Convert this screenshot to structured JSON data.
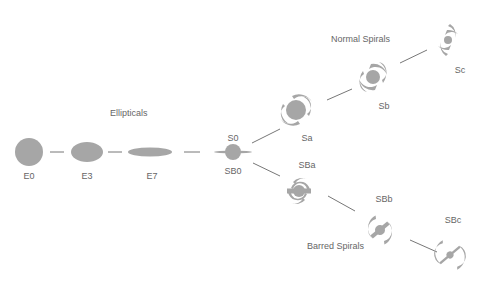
{
  "diagram": {
    "colors": {
      "galaxy": "#a6a6a6",
      "line": "#777777",
      "text": "#666666"
    },
    "groups": {
      "ellipticals": "Ellipticals",
      "normal_spirals": "Normal Spirals",
      "barred_spirals": "Barred Spirals"
    },
    "nodes": {
      "e0": "E0",
      "e3": "E3",
      "e7": "E7",
      "s0": "S0",
      "sb0": "SB0",
      "sa": "Sa",
      "sb": "Sb",
      "sc": "Sc",
      "sba": "SBa",
      "sbb": "SBb",
      "sbc": "SBc"
    }
  }
}
